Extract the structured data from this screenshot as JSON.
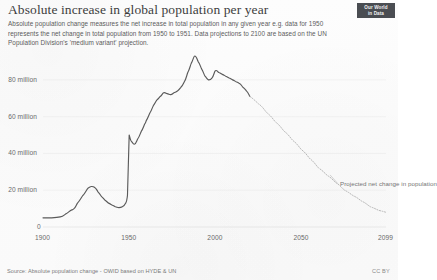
{
  "header": {
    "title": "Absolute increase in global population per year",
    "subtitle": "Absolute population change measures the net increase in total population in any given year e.g. data for 1950 represents the net change in total population from 1950 to 1951. Data projections to 2100 are based on the UN Population Division's 'medium variant' projection.",
    "logo_line1": "Our World",
    "logo_line2": "in Data"
  },
  "footer": {
    "source": "Source: Absolute population change - OWID based on HYDE & UN",
    "license": "CC BY"
  },
  "annotations": {
    "projection_label": "Projected net change in population"
  },
  "colors": {
    "line": "#5a5a5a",
    "projection": "#b9b9b9",
    "grid": "#ededed",
    "text": "#5c5c5c",
    "logo_bg": "#3b3f44"
  },
  "chart_data": {
    "type": "line",
    "title": "Absolute increase in global population per year",
    "xlabel": "",
    "ylabel": "",
    "xlim": [
      1900,
      2099
    ],
    "ylim": [
      0,
      93
    ],
    "grid": true,
    "legend": "none",
    "y_ticks": [
      0,
      20,
      40,
      60,
      80
    ],
    "y_tick_labels": [
      "0",
      "20 million",
      "40 million",
      "60 million",
      "80 million"
    ],
    "x_ticks": [
      1900,
      1950,
      2000,
      2050,
      2099
    ],
    "x_tick_labels": [
      "1900",
      "1950",
      "2000",
      "2050",
      "2099"
    ],
    "series": [
      {
        "name": "Historical net change in population",
        "style": "solid",
        "x": [
          1900,
          1905,
          1910,
          1913,
          1916,
          1918,
          1920,
          1923,
          1926,
          1928,
          1930,
          1932,
          1934,
          1936,
          1938,
          1940,
          1942,
          1944,
          1946,
          1948,
          1949,
          1950,
          1951,
          1953,
          1955,
          1957,
          1959,
          1960,
          1962,
          1964,
          1966,
          1968,
          1970,
          1972,
          1974,
          1976,
          1978,
          1980,
          1982,
          1984,
          1986,
          1988,
          1990,
          1992,
          1994,
          1996,
          1998,
          2000,
          2002,
          2004,
          2006,
          2008,
          2010,
          2012,
          2014,
          2016,
          2018,
          2020
        ],
        "values": [
          5,
          5,
          5.5,
          7,
          9,
          10,
          13,
          17,
          21,
          22,
          21.5,
          19,
          16.5,
          14.5,
          13,
          12,
          11,
          10.5,
          11,
          13,
          17,
          50,
          47,
          45,
          48,
          52,
          56,
          58,
          62,
          66,
          69,
          71,
          73,
          72.5,
          72,
          73,
          74,
          76,
          79,
          84,
          89,
          93,
          90,
          86,
          82,
          80,
          81,
          85,
          84,
          83,
          82,
          81,
          80,
          79,
          78,
          76,
          74,
          71
        ]
      },
      {
        "name": "Projected net change in population",
        "style": "dotted",
        "x": [
          2020,
          2025,
          2030,
          2035,
          2040,
          2045,
          2050,
          2055,
          2060,
          2065,
          2070,
          2075,
          2080,
          2085,
          2090,
          2095,
          2099
        ],
        "values": [
          71,
          67,
          62,
          57,
          52,
          47,
          42,
          37,
          32,
          28,
          24,
          20,
          17,
          14,
          11,
          9,
          8
        ]
      }
    ]
  }
}
